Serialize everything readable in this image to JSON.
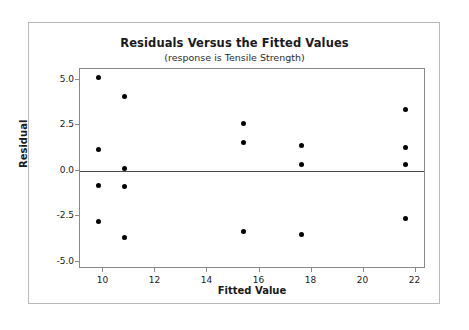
{
  "chart_data": {
    "type": "scatter",
    "title": "Residuals Versus the Fitted Values",
    "subtitle": "(response is Tensile Strength)",
    "xlabel": "Fitted Value",
    "ylabel": "Residual",
    "xlim": [
      9.1,
      22.4
    ],
    "ylim": [
      -5.4,
      5.6
    ],
    "xticks": [
      10,
      12,
      14,
      16,
      18,
      20,
      22
    ],
    "xtick_labels": [
      "10",
      "12",
      "14",
      "16",
      "18",
      "20",
      "22"
    ],
    "yticks": [
      5.0,
      2.5,
      0.0,
      -2.5,
      -5.0
    ],
    "ytick_labels": [
      "5.0",
      "2.5",
      "0.0",
      "-2.5",
      "-5.0"
    ],
    "grid": false,
    "legend": false,
    "reference_line": {
      "axis": "y",
      "value": 0.0,
      "color": "#4a4a4a"
    },
    "marker": {
      "shape": "circle",
      "color": "#000000",
      "size": 5
    },
    "points": [
      {
        "x": 9.8,
        "y": 5.15
      },
      {
        "x": 9.8,
        "y": 1.2
      },
      {
        "x": 9.8,
        "y": -0.8
      },
      {
        "x": 9.8,
        "y": -2.8
      },
      {
        "x": 10.8,
        "y": 4.1
      },
      {
        "x": 10.8,
        "y": 0.15
      },
      {
        "x": 10.8,
        "y": -0.85
      },
      {
        "x": 10.8,
        "y": -3.65
      },
      {
        "x": 15.4,
        "y": 2.6
      },
      {
        "x": 15.4,
        "y": 1.55
      },
      {
        "x": 15.4,
        "y": -3.35
      },
      {
        "x": 17.6,
        "y": 1.4
      },
      {
        "x": 17.6,
        "y": 0.35
      },
      {
        "x": 17.6,
        "y": -3.5
      },
      {
        "x": 21.6,
        "y": 3.35
      },
      {
        "x": 21.6,
        "y": 1.3
      },
      {
        "x": 21.6,
        "y": 0.35
      },
      {
        "x": 21.6,
        "y": -2.6
      }
    ]
  }
}
